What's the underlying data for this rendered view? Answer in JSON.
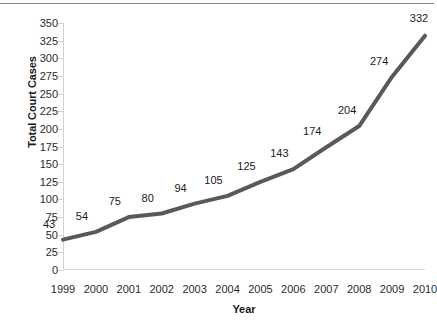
{
  "chart_data": {
    "type": "line",
    "title": "",
    "xlabel": "Year",
    "ylabel": "Total Court Cases",
    "categories": [
      "1999",
      "2000",
      "2001",
      "2002",
      "2003",
      "2004",
      "2005",
      "2006",
      "2007",
      "2008",
      "2009",
      "2010"
    ],
    "values": [
      43,
      54,
      75,
      80,
      94,
      105,
      125,
      143,
      174,
      204,
      274,
      332
    ],
    "data_labels": [
      "43",
      "54",
      "75",
      "80",
      "94",
      "105",
      "125",
      "143",
      "174",
      "204",
      "274",
      "332"
    ],
    "ylim": [
      0,
      350
    ],
    "ytick_step": 25,
    "yticks": [
      350,
      325,
      300,
      275,
      250,
      225,
      200,
      175,
      150,
      125,
      100,
      75,
      50,
      25,
      0
    ],
    "ytick_labels": [
      "350",
      "325",
      "300",
      "275",
      "250",
      "225",
      "200",
      "175",
      "150",
      "125",
      "100",
      "75",
      "50",
      "25",
      "0"
    ],
    "grid": false,
    "legend": null,
    "series": [
      {
        "name": "Total Court Cases",
        "color": "#595959",
        "line_width": 4,
        "markers": false,
        "values": [
          43,
          54,
          75,
          80,
          94,
          105,
          125,
          143,
          174,
          204,
          274,
          332
        ]
      }
    ],
    "colors": {
      "line": "#595959",
      "axis": "#d2d2d2",
      "text": "#1a1a1a",
      "tick_text": "#2b2b2b",
      "background": "#ffffff",
      "top_rule": "#8a8a8a"
    }
  }
}
